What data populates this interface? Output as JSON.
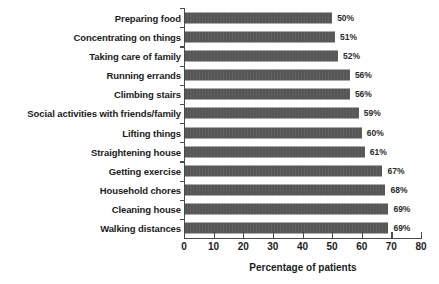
{
  "chart_data": {
    "type": "bar",
    "orientation": "horizontal",
    "title": "",
    "xlabel": "Percentage of patients",
    "ylabel": "",
    "xlim": [
      0,
      80
    ],
    "xticks": [
      0,
      10,
      20,
      30,
      40,
      50,
      60,
      70,
      80
    ],
    "grid": false,
    "legend": false,
    "bar_color": "#565656",
    "categories": [
      "Preparing food",
      "Concentrating on things",
      "Taking care of family",
      "Running errands",
      "Climbing stairs",
      "Social activities with friends/family",
      "Lifting things",
      "Straightening house",
      "Getting exercise",
      "Household chores",
      "Cleaning house",
      "Walking distances"
    ],
    "values": [
      50,
      51,
      52,
      56,
      56,
      59,
      60,
      61,
      67,
      68,
      69,
      69
    ],
    "value_labels": [
      "50%",
      "51%",
      "52%",
      "56%",
      "56%",
      "59%",
      "60%",
      "61%",
      "67%",
      "68%",
      "69%",
      "69%"
    ]
  }
}
